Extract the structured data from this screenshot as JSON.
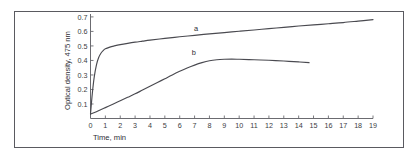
{
  "figure": {
    "border_color": "#5a5a60",
    "background": "#ffffff"
  },
  "chart_data": {
    "type": "line",
    "title": "",
    "subtitle": "",
    "xlabel": "Time, min",
    "ylabel": "Optical density, 475 nm",
    "xlim": [
      0,
      19
    ],
    "ylim": [
      0,
      0.72
    ],
    "grid": false,
    "legend_position": "inline-curve-labels",
    "xticks": [
      0,
      1,
      2,
      3,
      4,
      5,
      6,
      7,
      8,
      9,
      10,
      11,
      12,
      13,
      14,
      15,
      16,
      17,
      18,
      19
    ],
    "xticklabels": [
      "0",
      "1",
      "2",
      "3",
      "4",
      "5",
      "6",
      "7",
      "8",
      "9",
      "10",
      "11",
      "12",
      "13",
      "14",
      "15",
      "16",
      "17",
      "18",
      "19"
    ],
    "yticks": [
      0.1,
      0.2,
      0.3,
      0.4,
      0.5,
      0.6,
      0.7
    ],
    "yticklabels": [
      "0.1",
      "0.2",
      "0.3",
      "0.4",
      "0.5",
      "0.6",
      "0.7"
    ],
    "line_color": "#4a4a50",
    "series": [
      {
        "name": "a",
        "label": "a",
        "label_x": 7.1,
        "label_y": 0.605,
        "x": [
          0,
          0.12,
          0.25,
          0.4,
          0.55,
          0.7,
          0.85,
          1.0,
          1.3,
          1.6,
          2.0,
          2.5,
          3.0,
          3.5,
          4.0,
          5.0,
          6.0,
          7.0,
          8.0,
          9.0,
          10.0,
          11.0,
          12.0,
          13.0,
          14.0,
          15.0,
          16.0,
          17.0,
          18.0,
          19.0
        ],
        "y": [
          0.03,
          0.17,
          0.285,
          0.37,
          0.42,
          0.45,
          0.468,
          0.48,
          0.492,
          0.5,
          0.509,
          0.518,
          0.526,
          0.533,
          0.54,
          0.552,
          0.563,
          0.573,
          0.583,
          0.592,
          0.601,
          0.61,
          0.619,
          0.628,
          0.637,
          0.645,
          0.653,
          0.661,
          0.671,
          0.681
        ]
      },
      {
        "name": "b",
        "label": "b",
        "label_x": 6.95,
        "label_y": 0.438,
        "x": [
          0,
          0.5,
          1.0,
          1.5,
          2.0,
          2.5,
          3.0,
          3.5,
          4.0,
          4.5,
          5.0,
          5.5,
          6.0,
          6.5,
          7.0,
          7.5,
          8.0,
          8.5,
          9.0,
          9.5,
          10.0,
          11.0,
          12.0,
          13.0,
          14.0,
          14.7
        ],
        "y": [
          0.03,
          0.052,
          0.075,
          0.098,
          0.122,
          0.146,
          0.17,
          0.196,
          0.222,
          0.248,
          0.274,
          0.3,
          0.325,
          0.348,
          0.368,
          0.385,
          0.398,
          0.405,
          0.408,
          0.409,
          0.408,
          0.405,
          0.401,
          0.396,
          0.39,
          0.385
        ]
      }
    ]
  }
}
